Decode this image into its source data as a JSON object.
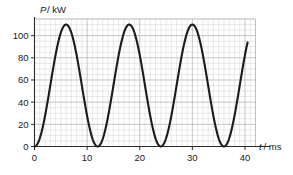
{
  "chart_data": {
    "type": "line",
    "title": "",
    "subtitle": "",
    "xlabel": "t / ms",
    "ylabel": "P / kW",
    "xlabel_symbol": "t",
    "xlabel_unit": "/ ms",
    "ylabel_symbol": "P",
    "ylabel_unit": "/ kW",
    "xlim": [
      0,
      42
    ],
    "ylim": [
      0,
      115
    ],
    "xticks": [
      0,
      10,
      20,
      30,
      40
    ],
    "xticklabels": [
      "0",
      "10",
      "20",
      "30",
      "40"
    ],
    "yticks": [
      0,
      20,
      40,
      60,
      80,
      100
    ],
    "yticklabels": [
      "0",
      "20",
      "40",
      "60",
      "80",
      "100"
    ],
    "x_minor_step": 1,
    "y_minor_step": 5,
    "grid": true,
    "grid_minor": true,
    "legend": "none",
    "curve_color": "#1b1b1b",
    "grid_minor_color": "#c9c9c9",
    "grid_major_color": "#a8a8a8",
    "axis_color": "#2b2b2b",
    "amplitude": 55,
    "offset": 55,
    "peak_value": 110,
    "min_value": 0,
    "period_ms": 12,
    "peaks_t": [
      6,
      18,
      30
    ],
    "minima_t": [
      0,
      12,
      24,
      36
    ],
    "x_end": 40.5,
    "y_end": 90,
    "x": [
      0,
      0.5,
      1,
      1.5,
      2,
      2.5,
      3,
      3.5,
      4,
      4.5,
      5,
      5.5,
      6,
      6.5,
      7,
      7.5,
      8,
      8.5,
      9,
      9.5,
      10,
      10.5,
      11,
      11.5,
      12,
      12.5,
      13,
      13.5,
      14,
      14.5,
      15,
      15.5,
      16,
      16.5,
      17,
      17.5,
      18,
      18.5,
      19,
      19.5,
      20,
      20.5,
      21,
      21.5,
      22,
      22.5,
      23,
      23.5,
      24,
      24.5,
      25,
      25.5,
      26,
      26.5,
      27,
      27.5,
      28,
      28.5,
      29,
      29.5,
      30,
      30.5,
      31,
      31.5,
      32,
      32.5,
      33,
      33.5,
      34,
      34.5,
      35,
      35.5,
      36,
      36.5,
      37,
      37.5,
      38,
      38.5,
      39,
      39.5,
      40,
      40.5
    ],
    "y": [
      0.0,
      3.7,
      14.3,
      30.3,
      49.1,
      68.1,
      85.0,
      97.8,
      105.7,
      108.3,
      105.7,
      97.8,
      85.0,
      68.1,
      49.1,
      30.3,
      14.3,
      3.7,
      0.0,
      3.7,
      14.3,
      30.3,
      49.1,
      68.1,
      85.0,
      97.8,
      105.7,
      108.3,
      105.7,
      97.8,
      85.0,
      68.1,
      49.1,
      30.3,
      14.3,
      3.7,
      0.0,
      3.7,
      14.3,
      30.3,
      49.1,
      68.1,
      85.0,
      97.8,
      105.7,
      108.3,
      105.7,
      97.8,
      85.0,
      68.1,
      49.1,
      30.3,
      14.3,
      3.7,
      0.0,
      3.7,
      14.3,
      30.3,
      49.1,
      68.1,
      85.0,
      97.8,
      105.7,
      108.3,
      105.7,
      97.8,
      85.0,
      68.1,
      49.1,
      30.3,
      14.3,
      3.7,
      0.0,
      3.7,
      14.3,
      30.3,
      49.1,
      68.1,
      85.0,
      97.8,
      105.7,
      108.3
    ]
  }
}
